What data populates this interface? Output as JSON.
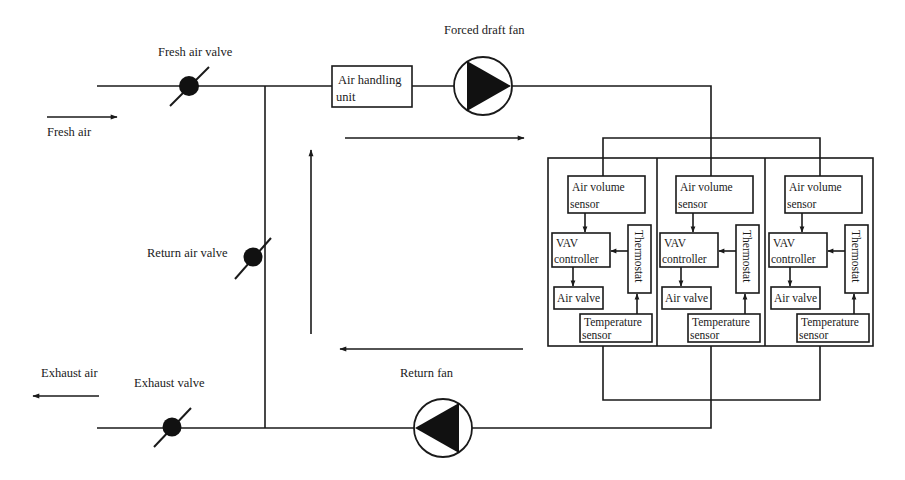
{
  "diagram": {
    "labels": {
      "fresh_air_valve": "Fresh air valve",
      "forced_draft_fan": "Forced draft fan",
      "fresh_air": "Fresh air",
      "air_handling_unit_line1": "Air handling",
      "air_handling_unit_line2": "unit",
      "return_air_valve": "Return air valve",
      "exhaust_air": "Exhaust air",
      "exhaust_valve": "Exhaust valve",
      "return_fan": "Return fan"
    },
    "zones": [
      {
        "air_volume_sensor": [
          "Air volume",
          "sensor"
        ],
        "vav_controller": [
          "VAV",
          "controller"
        ],
        "thermostat": "Thermostat",
        "air_valve": "Air valve",
        "temperature_sensor": [
          "Temperature",
          "sensor"
        ]
      },
      {
        "air_volume_sensor": [
          "Air volume",
          "sensor"
        ],
        "vav_controller": [
          "VAV",
          "controller"
        ],
        "thermostat": "Thermostat",
        "air_valve": "Air valve",
        "temperature_sensor": [
          "Temperature",
          "sensor"
        ]
      },
      {
        "air_volume_sensor": [
          "Air volume",
          "sensor"
        ],
        "vav_controller": [
          "VAV",
          "controller"
        ],
        "thermostat": "Thermostat",
        "air_valve": "Air valve",
        "temperature_sensor": [
          "Temperature",
          "sensor"
        ]
      }
    ],
    "flow_arrows": [
      {
        "name": "fresh-air-inflow",
        "direction": "right"
      },
      {
        "name": "supply-air-flow",
        "direction": "right"
      },
      {
        "name": "recirculation-flow",
        "direction": "up"
      },
      {
        "name": "return-air-flow",
        "direction": "left"
      },
      {
        "name": "exhaust-air-outflow",
        "direction": "left"
      }
    ],
    "colors": {
      "line": "#1a1a1a",
      "background": "#ffffff"
    }
  }
}
